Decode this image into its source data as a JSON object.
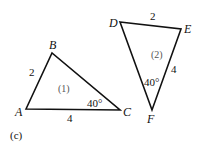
{
  "figure_label": "(c)",
  "triangles": [
    {
      "name": "(1)",
      "vertices": {
        "A": "A",
        "B": "B",
        "C": "C"
      },
      "side_AB": "2",
      "side_AC": "4",
      "angle_C": "40°"
    },
    {
      "name": "(2)",
      "vertices": {
        "D": "D",
        "E": "E",
        "F": "F"
      },
      "side_DE": "2",
      "side_EF": "4",
      "angle_F": "40°"
    }
  ]
}
